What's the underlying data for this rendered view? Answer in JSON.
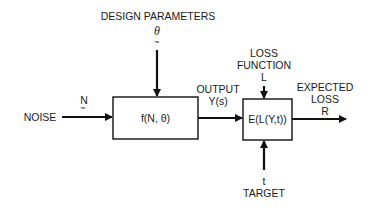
{
  "diagram": {
    "design_parameters": {
      "label": "DESIGN PARAMETERS",
      "symbol": "θ"
    },
    "noise": {
      "label": "NOISE",
      "symbol": "N"
    },
    "system_block": {
      "label": "f(N,  θ)"
    },
    "output": {
      "label": "OUTPUT",
      "symbol": "Y(s)"
    },
    "loss_function": {
      "line1": "LOSS",
      "line2": "FUNCTION",
      "symbol": "L"
    },
    "loss_block": {
      "label": "E(L(Y,t))"
    },
    "expected_loss": {
      "line1": "EXPECTED",
      "line2": "LOSS",
      "symbol": "R"
    },
    "target": {
      "label": "TARGET",
      "symbol": "t"
    },
    "tilde": "~"
  }
}
